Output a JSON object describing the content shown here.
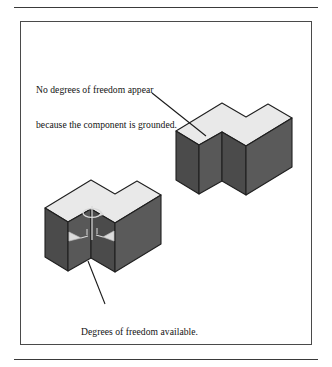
{
  "figure": {
    "frame": {
      "top_rule": "horizontal-rule",
      "bottom_rule": "horizontal-rule",
      "border_color": "#4a4a4a"
    },
    "annotations": [
      {
        "name": "grounded-note",
        "lines": [
          "No degrees of freedom appear",
          "because the component is grounded."
        ],
        "leader_from": [
          152,
          93
        ],
        "leader_to": [
          206,
          136
        ]
      },
      {
        "name": "dof-note",
        "lines": [
          "Degrees of freedom available."
        ],
        "leader_from": [
          88,
          261
        ],
        "leader_to": [
          105,
          304
        ]
      }
    ],
    "objects": [
      {
        "name": "grounded-block",
        "shape": "L-shaped notched block",
        "position": "upper-right",
        "has_dof_symbols": false,
        "top_face_color": "#e9e9e9",
        "left_face_color": "#4b4b4b",
        "right_face_color": "#5a5a5a"
      },
      {
        "name": "free-block",
        "shape": "L-shaped notched block",
        "position": "lower-left",
        "has_dof_symbols": true,
        "top_face_color": "#e9e9e9",
        "left_face_color": "#4b4b4b",
        "right_face_color": "#5a5a5a",
        "dof_symbols": [
          "rotation-arc-arrow",
          "translation-cone-arrow-left",
          "translation-cone-arrow-right"
        ]
      }
    ],
    "colors": {
      "ink": "#121212",
      "top_face": "#e9e9e9",
      "dark_face": "#4b4b4b",
      "mid_face": "#5a5a5a",
      "outline": "#1f1f1f",
      "dof_symbol": "#d8d8d8"
    }
  }
}
